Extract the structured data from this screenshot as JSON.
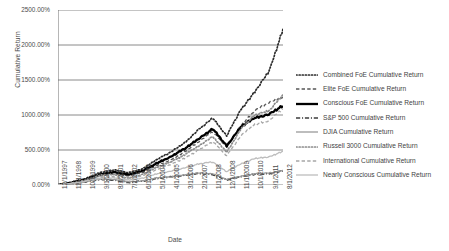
{
  "chart_data": {
    "type": "line",
    "title": "",
    "xlabel": "Date",
    "ylabel": "Cumulative Return",
    "grid": true,
    "legend_position": "right",
    "ylim": [
      0,
      2500
    ],
    "ytick_labels": [
      "2500.00%",
      "2000.00%",
      "1500.00%",
      "1000.00%",
      "500.00%",
      "0.00%"
    ],
    "ytick_values": [
      2500,
      2000,
      1500,
      1000,
      500,
      0
    ],
    "categories": [
      "12/1/1997",
      "11/1/1998",
      "10/1/1999",
      "9/1/2000",
      "8/1/2001",
      "7/1/2002",
      "6/1/2003",
      "5/1/2004",
      "4/1/2005",
      "3/1/2006",
      "2/1/2007",
      "1/1/2008",
      "12/1/2008",
      "11/1/2009",
      "10/1/2010",
      "9/1/2011",
      "8/1/2012"
    ],
    "series": [
      {
        "name": "Combined FoE Cumulative Return",
        "style": "dotted",
        "color": "#2b2b2b",
        "values": [
          0,
          40,
          95,
          180,
          215,
          175,
          230,
          360,
          470,
          600,
          790,
          960,
          700,
          1080,
          1330,
          1620,
          2230
        ]
      },
      {
        "name": "Elite FoE Cumulative Return",
        "style": "dashed",
        "color": "#555555",
        "values": [
          0,
          30,
          70,
          130,
          160,
          130,
          175,
          275,
          360,
          470,
          620,
          760,
          540,
          850,
          1060,
          1180,
          1260
        ]
      },
      {
        "name": "Conscious FoE Cumulative Return",
        "style": "solid-thick",
        "color": "#000000",
        "values": [
          0,
          35,
          80,
          150,
          185,
          150,
          200,
          310,
          400,
          520,
          660,
          800,
          560,
          830,
          960,
          1010,
          1130
        ]
      },
      {
        "name": "S&P 500 Cumulative Return",
        "style": "dash-dot",
        "color": "#3d3d3d",
        "values": [
          0,
          18,
          45,
          80,
          70,
          35,
          55,
          95,
          115,
          140,
          165,
          150,
          70,
          120,
          155,
          160,
          200
        ]
      },
      {
        "name": "DJIA Cumulative Return",
        "style": "solid",
        "color": "#9a9a9a",
        "values": [
          0,
          20,
          50,
          85,
          80,
          45,
          60,
          100,
          118,
          145,
          172,
          160,
          80,
          125,
          160,
          170,
          210
        ]
      },
      {
        "name": "Russell 3000 Cumulative Return",
        "style": "dotted",
        "color": "#8c8c8c",
        "values": [
          0,
          28,
          70,
          140,
          150,
          100,
          150,
          250,
          330,
          430,
          560,
          690,
          470,
          800,
          1000,
          1060,
          1290
        ]
      },
      {
        "name": "International Cumulative Return",
        "style": "dashed",
        "color": "#a6a6a6",
        "values": [
          0,
          22,
          60,
          110,
          120,
          95,
          130,
          220,
          290,
          380,
          500,
          620,
          420,
          700,
          870,
          920,
          1090
        ]
      },
      {
        "name": "Nearly Conscious Cumulative Return",
        "style": "solid",
        "color": "#bdbdbd",
        "values": [
          0,
          25,
          55,
          95,
          105,
          70,
          95,
          160,
          195,
          245,
          300,
          330,
          190,
          300,
          380,
          400,
          480
        ]
      }
    ]
  }
}
